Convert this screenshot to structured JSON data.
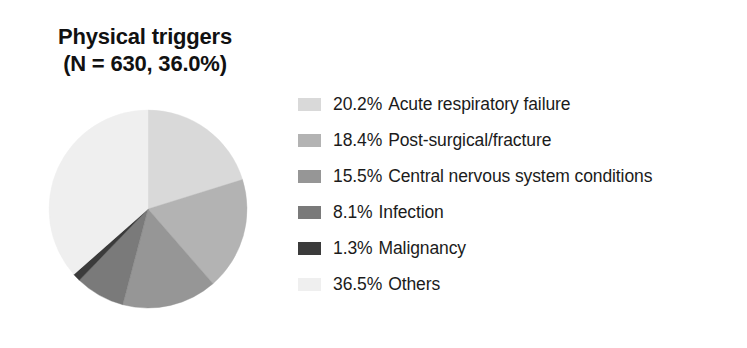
{
  "chart_data": {
    "type": "pie",
    "title": "Physical triggers",
    "subtitle": "(N = 630, 36.0%)",
    "title_lines": [
      "Physical triggers",
      "(N = 630, 36.0%)"
    ],
    "total_n": 630,
    "total_pct": "36.0%",
    "xlabel": "",
    "ylabel": "",
    "legend_position": "right",
    "start_angle_deg": 0,
    "direction": "clockwise",
    "categories": [
      "Acute respiratory failure",
      "Post-surgical/fracture",
      "Central nervous system conditions",
      "Infection",
      "Malignancy",
      "Others"
    ],
    "values": [
      20.2,
      18.4,
      15.5,
      8.1,
      1.3,
      36.5
    ],
    "value_labels": [
      "20.2%",
      "18.4%",
      "15.5%",
      "8.1%",
      "1.3%",
      "36.5%"
    ],
    "colors": [
      "#d9d9d9",
      "#b3b3b3",
      "#969696",
      "#7a7a7a",
      "#3b3b3b",
      "#efefef"
    ],
    "slices": [
      {
        "label": "Acute respiratory failure",
        "pct": "20.2%",
        "value": 20.2,
        "color": "#d9d9d9"
      },
      {
        "label": "Post-surgical/fracture",
        "pct": "18.4%",
        "value": 18.4,
        "color": "#b3b3b3"
      },
      {
        "label": "Central nervous system conditions",
        "pct": "15.5%",
        "value": 15.5,
        "color": "#969696"
      },
      {
        "label": "Infection",
        "pct": "8.1%",
        "value": 8.1,
        "color": "#7a7a7a"
      },
      {
        "label": "Malignancy",
        "pct": "1.3%",
        "value": 1.3,
        "color": "#3b3b3b"
      },
      {
        "label": "Others",
        "pct": "36.5%",
        "value": 36.5,
        "color": "#efefef"
      }
    ]
  },
  "legend": {
    "items": [
      {
        "pct": "20.2%",
        "label": "Acute respiratory failure",
        "color": "#d9d9d9"
      },
      {
        "pct": "18.4%",
        "label": "Post-surgical/fracture",
        "color": "#b3b3b3"
      },
      {
        "pct": "15.5%",
        "label": "Central nervous system conditions",
        "color": "#969696"
      },
      {
        "pct": "8.1%",
        "label": "Infection",
        "color": "#7a7a7a"
      },
      {
        "pct": "1.3%",
        "label": "Malignancy",
        "color": "#3b3b3b"
      },
      {
        "pct": "36.5%",
        "label": "Others",
        "color": "#efefef"
      }
    ]
  }
}
